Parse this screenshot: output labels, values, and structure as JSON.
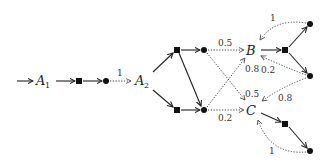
{
  "diagram": {
    "type": "markov-decision-process",
    "states": [
      {
        "id": "A1",
        "label": "A",
        "sub": "1"
      },
      {
        "id": "A2",
        "label": "A",
        "sub": "2"
      },
      {
        "id": "B",
        "label": "B"
      },
      {
        "id": "C",
        "label": "C"
      }
    ],
    "probabilities": {
      "to_A2": "1",
      "top_to_B": "0.5",
      "bottom_to_B": "0.8",
      "top_to_C": "0.5",
      "bottom_to_C": "0.2",
      "loop_B_top": "1",
      "loop_B_mid": "0.2",
      "loop_C_mid": "0.8",
      "loop_C_bottom": "1"
    }
  }
}
